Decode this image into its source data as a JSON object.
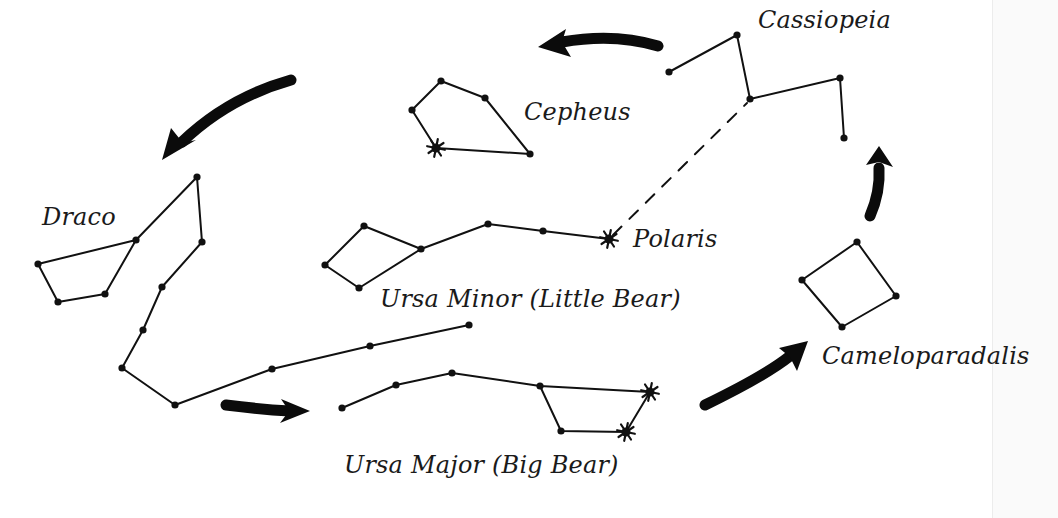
{
  "diagram": {
    "labels": {
      "draco": "Draco",
      "cepheus": "Cepheus",
      "cassiopeia": "Cassiopeia",
      "polaris": "Polaris",
      "ursa_minor": "Ursa Minor (Little Bear)",
      "ursa_major": "Ursa Major (Big Bear)",
      "cameleopardalis": "Cameloparadalis"
    },
    "constellations": [
      {
        "name": "Draco",
        "stars": [
          [
            38,
            264
          ],
          [
            58,
            302
          ],
          [
            105,
            294
          ],
          [
            136,
            240
          ],
          [
            197,
            177
          ],
          [
            202,
            242
          ],
          [
            162,
            287
          ],
          [
            143,
            330
          ],
          [
            122,
            368
          ],
          [
            175,
            405
          ],
          [
            272,
            369
          ],
          [
            370,
            346
          ],
          [
            469,
            325
          ]
        ],
        "paths": [
          [
            0,
            1,
            2,
            3,
            0
          ],
          [
            3,
            4,
            5,
            6,
            7,
            8,
            9,
            10,
            11,
            12
          ]
        ]
      },
      {
        "name": "Cepheus",
        "stars": [
          [
            412,
            110
          ],
          [
            441,
            81
          ],
          [
            485,
            98
          ],
          [
            530,
            154
          ],
          [
            436,
            148
          ]
        ],
        "bright": [
          4
        ],
        "paths": [
          [
            4,
            0,
            1,
            2,
            3,
            4
          ]
        ]
      },
      {
        "name": "Cassiopeia",
        "stars": [
          [
            669,
            72
          ],
          [
            737,
            35
          ],
          [
            750,
            99
          ],
          [
            840,
            78
          ],
          [
            844,
            138
          ]
        ],
        "paths": [
          [
            0,
            1,
            2,
            3,
            4
          ]
        ]
      },
      {
        "name": "Ursa Minor",
        "stars": [
          [
            325,
            265
          ],
          [
            364,
            226
          ],
          [
            421,
            249
          ],
          [
            359,
            288
          ],
          [
            488,
            224
          ],
          [
            543,
            231
          ],
          [
            609,
            239
          ]
        ],
        "bright": [
          6
        ],
        "paths": [
          [
            0,
            1,
            2,
            3,
            0
          ],
          [
            2,
            4,
            5,
            6
          ]
        ]
      },
      {
        "name": "Ursa Major",
        "stars": [
          [
            342,
            408
          ],
          [
            396,
            385
          ],
          [
            452,
            373
          ],
          [
            540,
            386
          ],
          [
            650,
            392
          ],
          [
            626,
            432
          ],
          [
            561,
            431
          ]
        ],
        "bright": [
          4,
          5
        ],
        "paths": [
          [
            0,
            1,
            2,
            3,
            4,
            5,
            6,
            3
          ]
        ]
      },
      {
        "name": "Cameleopardalis",
        "stars": [
          [
            802,
            280
          ],
          [
            857,
            242
          ],
          [
            896,
            296
          ],
          [
            842,
            327
          ]
        ],
        "paths": [
          [
            0,
            1,
            2,
            3,
            0
          ]
        ]
      }
    ],
    "pointer_line": {
      "from": [
        609,
        239
      ],
      "to": [
        750,
        99
      ],
      "style": "dashed"
    },
    "rotation_arrows": [
      {
        "name": "cassiopeia-to-cepheus",
        "direction": "left"
      },
      {
        "name": "cepheus-to-draco",
        "direction": "down-left"
      },
      {
        "name": "draco-to-ursa-major",
        "direction": "right"
      },
      {
        "name": "ursa-major-to-cameleopardalis",
        "direction": "up-right"
      },
      {
        "name": "cameleopardalis-to-cassiopeia",
        "direction": "up"
      }
    ]
  }
}
